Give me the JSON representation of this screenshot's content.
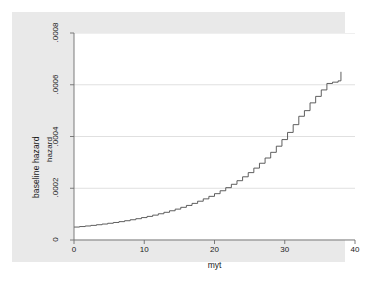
{
  "figure": {
    "background": "#ffffff",
    "graph_region_color": "#e9e9e9",
    "plot_area_color": "#ffffff"
  },
  "axes": {
    "y_title_outer": "baseline hazard",
    "y_title_inner": "hazard",
    "x_title": "myt",
    "y_ticks": [
      {
        "label": "0",
        "value": 0
      },
      {
        "label": ".0002",
        "value": 0.0002
      },
      {
        "label": ".0004",
        "value": 0.0004
      },
      {
        "label": ".0006",
        "value": 0.0006
      },
      {
        "label": ".0008",
        "value": 0.0008
      }
    ],
    "x_ticks": [
      {
        "label": "0",
        "value": 0
      },
      {
        "label": "10",
        "value": 10
      },
      {
        "label": "20",
        "value": 20
      },
      {
        "label": "30",
        "value": 30
      },
      {
        "label": "40",
        "value": 40
      }
    ]
  },
  "chart_data": {
    "type": "line",
    "title": "",
    "subtitle": "",
    "xlabel": "myt",
    "ylabel": "hazard",
    "y_axis_outer_label": "baseline hazard",
    "xlim": [
      0,
      40
    ],
    "ylim": [
      0,
      0.0008
    ],
    "grid": "horizontal",
    "gridlines_y": [
      0,
      0.0002,
      0.0004,
      0.0006,
      0.0008
    ],
    "legend": "none",
    "line_color": "#4d4d4d",
    "line_width": 0.9,
    "drawstyle": "steps-post",
    "series": [
      {
        "name": "baseline hazard",
        "x": [
          0,
          0.8,
          1.6,
          2.4,
          3.2,
          4.0,
          4.8,
          5.6,
          6.4,
          7.2,
          8.0,
          8.8,
          9.6,
          10.4,
          11.2,
          12.0,
          12.8,
          13.6,
          14.4,
          15.2,
          16.0,
          16.8,
          17.6,
          18.4,
          19.2,
          20.0,
          20.8,
          21.6,
          22.4,
          23.2,
          24.0,
          24.8,
          25.6,
          26.4,
          27.2,
          28.0,
          28.8,
          29.6,
          30.4,
          31.2,
          32.0,
          32.8,
          33.6,
          34.4,
          35.2,
          36.0,
          36.8,
          37.6,
          38.0
        ],
        "y": [
          5e-05,
          5.2e-05,
          5.42e-05,
          5.65e-05,
          5.9e-05,
          6.17e-05,
          6.46e-05,
          6.77e-05,
          7.1e-05,
          7.45e-05,
          7.83e-05,
          8.23e-05,
          8.66e-05,
          9.12e-05,
          9.61e-05,
          0.0001014,
          0.000107,
          0.000113,
          0.0001194,
          0.0001263,
          0.0001336,
          0.0001415,
          0.0001499,
          0.000159,
          0.0001687,
          0.0001791,
          0.0001903,
          0.0002023,
          0.0002153,
          0.0002292,
          0.0002442,
          0.0002604,
          0.0002778,
          0.0002966,
          0.0003169,
          0.0003388,
          0.0003625,
          0.0003881,
          0.0004158,
          0.0004458,
          0.0004782,
          0.0005,
          0.00053,
          0.000555,
          0.00058,
          0.000605,
          0.00061,
          0.000615,
          0.00065
        ]
      }
    ]
  }
}
